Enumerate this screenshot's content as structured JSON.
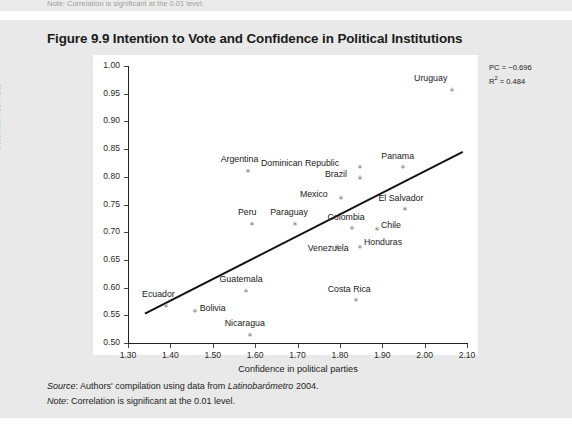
{
  "page": {
    "cut_note_top": "Note: Correlation is significant at the 0.01 level.",
    "figure_title": "Figure 9.9 Intention to Vote and Confidence in Political Institutions",
    "source_lead": "Source",
    "source_text": ": Authors' compilation using data from ",
    "source_italic_work": "Latinobarómetro",
    "source_year": " 2004.",
    "note_lead": "Note",
    "note_text": ": Correlation is significant at the 0.01 level."
  },
  "annotation": {
    "pc_label": "PC = −0.696",
    "r2_prefix": "R",
    "r2_sup": "2",
    "r2_value": " = 0.484"
  },
  "chart_data": {
    "type": "scatter",
    "title": "Figure 9.9 Intention to Vote and Confidence in Political Institutions",
    "xlabel": "Confidence in political parties",
    "ylabel": "Intention to vote",
    "xlim": [
      1.3,
      2.1
    ],
    "ylim": [
      0.5,
      1.0
    ],
    "xticks": [
      "1.30",
      "1.40",
      "1.50",
      "1.60",
      "1.70",
      "1.80",
      "1.90",
      "2.00",
      "2.10"
    ],
    "yticks": [
      "0.50",
      "0.55",
      "0.60",
      "0.65",
      "0.70",
      "0.75",
      "0.80",
      "0.85",
      "0.90",
      "0.95",
      "1.00"
    ],
    "grid": false,
    "legend": "none",
    "statistics": {
      "PC": -0.696,
      "R2": 0.484
    },
    "points": [
      {
        "name": "Uruguay",
        "x": 2.06,
        "y": 0.958,
        "label_dx": -36,
        "label_dy": -11
      },
      {
        "name": "Argentina",
        "x": 1.58,
        "y": 0.812,
        "label_dx": -26,
        "label_dy": -11
      },
      {
        "name": "Dominican Republic",
        "x": 1.845,
        "y": 0.818,
        "label_dx": -98,
        "label_dy": -4
      },
      {
        "name": "Panama",
        "x": 1.945,
        "y": 0.818,
        "label_dx": -20,
        "label_dy": -11
      },
      {
        "name": "Brazil",
        "x": 1.845,
        "y": 0.798,
        "label_dx": -34,
        "label_dy": -4
      },
      {
        "name": "Mexico",
        "x": 1.8,
        "y": 0.762,
        "label_dx": -40,
        "label_dy": -4
      },
      {
        "name": "El Salvador",
        "x": 1.95,
        "y": 0.742,
        "label_dx": -25,
        "label_dy": -11
      },
      {
        "name": "Peru",
        "x": 1.59,
        "y": 0.716,
        "label_dx": -13,
        "label_dy": -11
      },
      {
        "name": "Paraguay",
        "x": 1.69,
        "y": 0.716,
        "label_dx": -23,
        "label_dy": -11
      },
      {
        "name": "Colombia",
        "x": 1.825,
        "y": 0.708,
        "label_dx": -23,
        "label_dy": -11
      },
      {
        "name": "Chile",
        "x": 1.885,
        "y": 0.706,
        "label_dx": 5,
        "label_dy": -4
      },
      {
        "name": "Honduras",
        "x": 1.845,
        "y": 0.675,
        "label_dx": 5,
        "label_dy": -4
      },
      {
        "name": "Venezuela",
        "x": 1.79,
        "y": 0.675,
        "label_dx": -28,
        "label_dy": 2
      },
      {
        "name": "Guatemala",
        "x": 1.575,
        "y": 0.595,
        "label_dx": -25,
        "label_dy": -11
      },
      {
        "name": "Costa Rica",
        "x": 1.835,
        "y": 0.578,
        "label_dx": -27,
        "label_dy": -11
      },
      {
        "name": "Ecuador",
        "x": 1.385,
        "y": 0.568,
        "label_dx": -22,
        "label_dy": -11
      },
      {
        "name": "Bolivia",
        "x": 1.455,
        "y": 0.558,
        "label_dx": 6,
        "label_dy": -3
      },
      {
        "name": "Nicaragua",
        "x": 1.585,
        "y": 0.516,
        "label_dx": -24,
        "label_dy": -11
      }
    ],
    "trendline": {
      "x0": 1.34,
      "y0": 0.553,
      "x1": 2.09,
      "y1": 0.845
    }
  }
}
